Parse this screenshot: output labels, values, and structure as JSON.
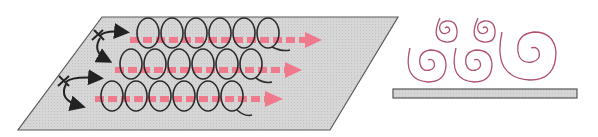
{
  "diagram": {
    "colors": {
      "surface_fill": "#d4d4d4",
      "surface_stroke": "#5a5a5a",
      "loop_stroke": "#2a2a2a",
      "flow_arrow": "#f07a8c",
      "spiral_stroke": "#b0506a",
      "bar_fill": "#d8d8d8",
      "bar_stroke": "#555555"
    },
    "rows": [
      {
        "loops": 6,
        "label": ""
      },
      {
        "loops": 6,
        "label": ""
      },
      {
        "loops": 6,
        "label": ""
      }
    ],
    "spirals": 5
  }
}
